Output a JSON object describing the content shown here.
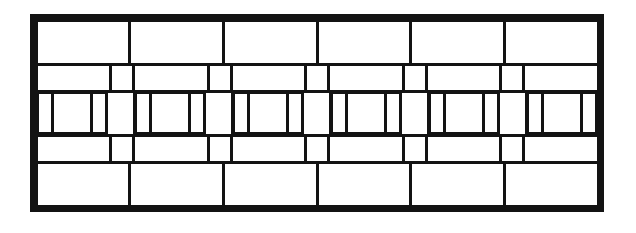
{
  "document": {
    "title": "Ornamental Grille Elevation",
    "kind": "line-drawing",
    "background_color": "#ffffff",
    "line_color": "#131313"
  },
  "grille": {
    "frame": {
      "label": "Outer frame",
      "x": 30,
      "y": 14,
      "width": 574,
      "height": 198,
      "border_width_px": 6
    },
    "rows": [
      {
        "name": "top-rail",
        "type": "panel-row",
        "height_px": 44,
        "panel_count": 6,
        "panels": [
          {
            "label": ""
          },
          {
            "label": ""
          },
          {
            "label": ""
          },
          {
            "label": ""
          },
          {
            "label": ""
          },
          {
            "label": ""
          }
        ]
      },
      {
        "name": "upper-band",
        "type": "band-row",
        "height_px": 27,
        "panel_count": 6,
        "stud_count": 5,
        "panels": [
          {
            "label": ""
          },
          {
            "label": ""
          },
          {
            "label": ""
          },
          {
            "label": ""
          },
          {
            "label": ""
          },
          {
            "label": ""
          }
        ],
        "studs": [
          {
            "label": ""
          },
          {
            "label": ""
          },
          {
            "label": ""
          },
          {
            "label": ""
          },
          {
            "label": ""
          }
        ]
      },
      {
        "name": "baluster-row",
        "type": "bay-row",
        "height_px": 62,
        "bay_count": 6,
        "post_count": 5,
        "bays": [
          {
            "label": "",
            "balusters": [
              "narrow",
              "wide",
              "narrow"
            ]
          },
          {
            "label": "",
            "balusters": [
              "narrow",
              "mid",
              "narrow"
            ]
          },
          {
            "label": "",
            "balusters": [
              "narrow",
              "mid",
              "narrow"
            ]
          },
          {
            "label": "",
            "balusters": [
              "narrow",
              "mid",
              "narrow"
            ]
          },
          {
            "label": "",
            "balusters": [
              "narrow",
              "mid",
              "narrow"
            ]
          },
          {
            "label": "",
            "balusters": [
              "narrow",
              "wide",
              "narrow"
            ]
          }
        ],
        "posts": [
          {
            "label": ""
          },
          {
            "label": ""
          },
          {
            "label": ""
          },
          {
            "label": ""
          },
          {
            "label": ""
          }
        ]
      },
      {
        "name": "lower-band",
        "type": "band-row",
        "height_px": 27,
        "panel_count": 6,
        "stud_count": 5,
        "panels": [
          {
            "label": ""
          },
          {
            "label": ""
          },
          {
            "label": ""
          },
          {
            "label": ""
          },
          {
            "label": ""
          },
          {
            "label": ""
          }
        ],
        "studs": [
          {
            "label": ""
          },
          {
            "label": ""
          },
          {
            "label": ""
          },
          {
            "label": ""
          },
          {
            "label": ""
          }
        ]
      },
      {
        "name": "bottom-rail",
        "type": "panel-row",
        "height_px": 44,
        "panel_count": 6,
        "panels": [
          {
            "label": ""
          },
          {
            "label": ""
          },
          {
            "label": ""
          },
          {
            "label": ""
          },
          {
            "label": ""
          },
          {
            "label": ""
          }
        ]
      }
    ]
  }
}
